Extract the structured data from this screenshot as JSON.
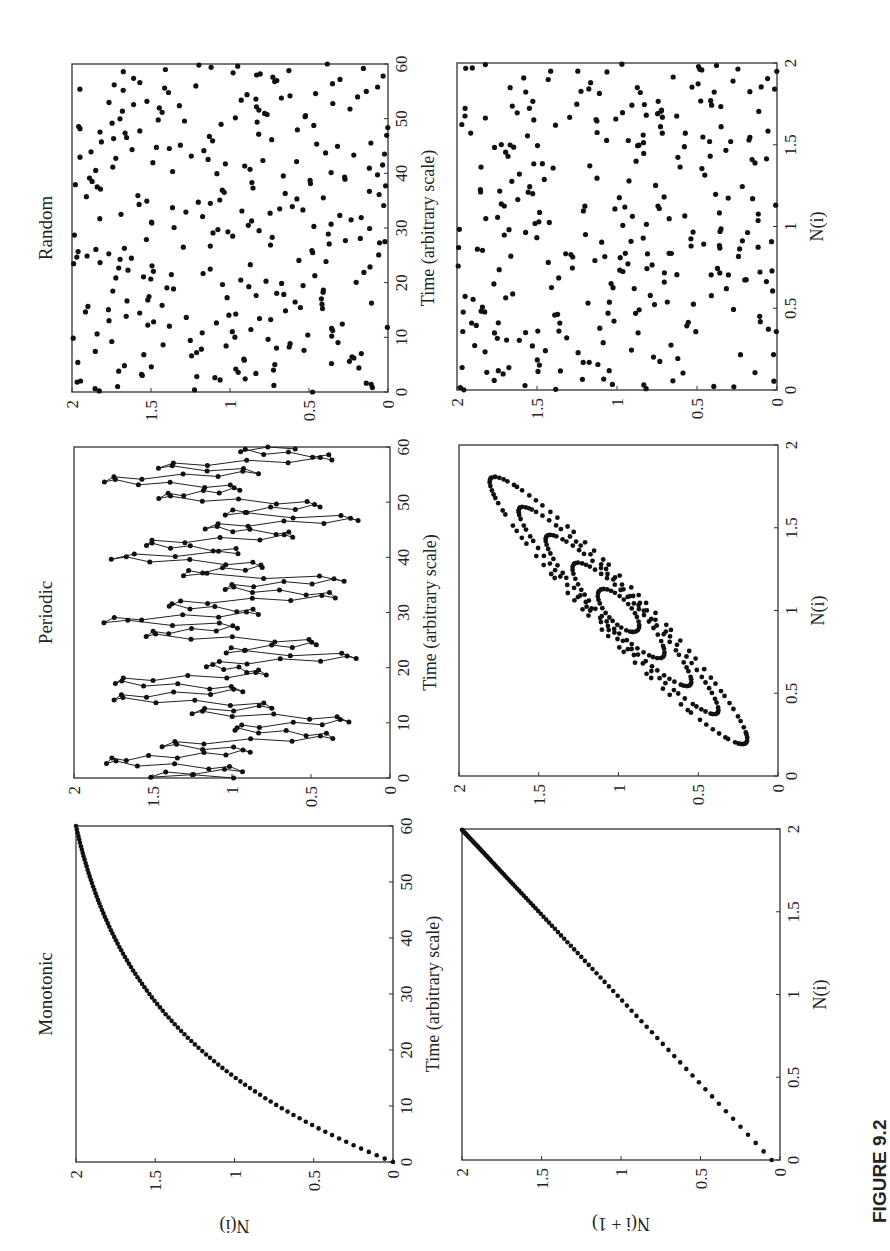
{
  "figure": {
    "label": "FIGURE 9.2",
    "rotation_deg": -90
  },
  "panels": [
    {
      "id": "monotonic",
      "title": "Monotonic",
      "time_series": {
        "xlabel": "Time (arbitrary scale)",
        "ylabel": "N(i)"
      },
      "return_map": {
        "xlabel": "N(i)",
        "ylabel": "N(i + 1)"
      }
    },
    {
      "id": "periodic",
      "title": "Periodic",
      "time_series": {
        "xlabel": "Time (arbitrary scale)",
        "ylabel": ""
      },
      "return_map": {
        "xlabel": "N(i)",
        "ylabel": ""
      }
    },
    {
      "id": "random",
      "title": "Random",
      "time_series": {
        "xlabel": "Time (arbitrary scale)",
        "ylabel": ""
      },
      "return_map": {
        "xlabel": "N(i)",
        "ylabel": ""
      }
    }
  ],
  "axes": {
    "time_ticks": [
      "0",
      "10",
      "20",
      "30",
      "40",
      "50",
      "60"
    ],
    "n_ticks": [
      "0",
      "0.5",
      "1",
      "1.5",
      "2"
    ]
  },
  "chart_data": [
    {
      "type": "scatter",
      "title": "Monotonic",
      "xlabel": "Time (arbitrary scale)",
      "ylabel": "N(i)",
      "xlim": [
        0,
        60
      ],
      "ylim": [
        0,
        2
      ],
      "model": "N(t) = 2*(1-exp(-t/25))/(1-exp(-60/25))",
      "sample_step": 0.6,
      "sample_points": [
        [
          0,
          0
        ],
        [
          10,
          0.73
        ],
        [
          20,
          1.21
        ],
        [
          30,
          1.54
        ],
        [
          40,
          1.76
        ],
        [
          50,
          1.89
        ],
        [
          60,
          2.0
        ]
      ]
    },
    {
      "type": "line",
      "title": "Periodic",
      "xlabel": "Time (arbitrary scale)",
      "ylabel": "N(i)",
      "xlim": [
        0,
        60
      ],
      "ylim": [
        0,
        2
      ],
      "markers": true,
      "sample_step": 0.25,
      "extrema": [
        [
          0,
          1.0
        ],
        [
          0.5,
          1.52
        ],
        [
          1.5,
          0.95
        ],
        [
          3,
          1.8
        ],
        [
          5,
          0.9
        ],
        [
          6,
          1.45
        ],
        [
          7.5,
          0.35
        ],
        [
          9,
          1.0
        ],
        [
          10.5,
          0.25
        ],
        [
          12,
          1.25
        ],
        [
          13,
          0.75
        ],
        [
          14.5,
          1.75
        ],
        [
          16,
          0.95
        ],
        [
          17.5,
          1.75
        ],
        [
          19,
          0.8
        ],
        [
          20.5,
          1.15
        ],
        [
          22,
          0.2
        ],
        [
          23,
          1.05
        ],
        [
          24.5,
          0.45
        ],
        [
          26,
          1.55
        ],
        [
          27.5,
          0.95
        ],
        [
          28.5,
          1.8
        ],
        [
          30,
          0.85
        ],
        [
          31.5,
          1.4
        ],
        [
          33,
          0.35
        ],
        [
          34.5,
          1.05
        ],
        [
          36,
          0.3
        ],
        [
          37,
          1.3
        ],
        [
          38.5,
          0.8
        ],
        [
          40,
          1.75
        ],
        [
          41,
          0.95
        ],
        [
          42.5,
          1.55
        ],
        [
          44,
          0.6
        ],
        [
          45.5,
          1.15
        ],
        [
          47,
          0.2
        ],
        [
          48,
          1.05
        ],
        [
          49.5,
          0.45
        ],
        [
          51,
          1.45
        ],
        [
          52.5,
          0.95
        ],
        [
          54,
          1.8
        ],
        [
          55.5,
          0.85
        ],
        [
          56.5,
          1.45
        ],
        [
          58,
          0.35
        ],
        [
          59.5,
          0.95
        ],
        [
          60,
          0.6
        ]
      ]
    },
    {
      "type": "scatter",
      "title": "Random",
      "xlabel": "Time (arbitrary scale)",
      "ylabel": "N(i)",
      "xlim": [
        0,
        60
      ],
      "ylim": [
        0,
        2
      ],
      "distribution": "uniform(0,2)",
      "n_points": 300,
      "seed": 7
    },
    {
      "type": "scatter",
      "title": "Monotonic return map",
      "xlabel": "N(i)",
      "ylabel": "N(i + 1)",
      "xlim": [
        0,
        2
      ],
      "ylim": [
        0,
        2
      ],
      "description": "points along diagonal N(i+1) ≈ N(i) from (0,0) to (2,2), denser near 2"
    },
    {
      "type": "scatter",
      "title": "Periodic return map",
      "xlabel": "N(i)",
      "ylabel": "N(i + 1)",
      "xlim": [
        0,
        2
      ],
      "ylim": [
        0,
        2
      ],
      "description": "nested elliptical loops along diagonal from (0.2,0.2) to (1.8,1.8), centered at (1,1)"
    },
    {
      "type": "scatter",
      "title": "Random return map",
      "xlabel": "N(i)",
      "ylabel": "N(i + 1)",
      "xlim": [
        0,
        2
      ],
      "ylim": [
        0,
        2
      ],
      "description": "uniformly scattered points filling the square"
    }
  ],
  "colors": {
    "ink": "#111111",
    "axis": "#333333",
    "background": "#ffffff"
  }
}
